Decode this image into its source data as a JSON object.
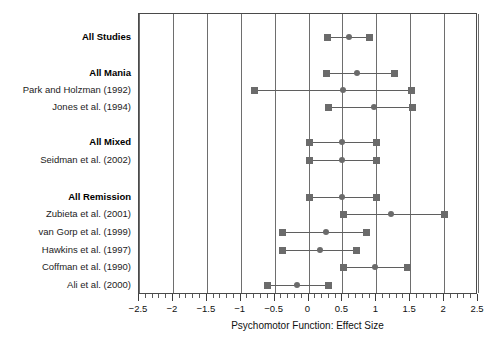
{
  "chart_data": {
    "type": "forest",
    "title": "",
    "xlabel": "Psychomotor Function: Effect Size",
    "ylabel": "",
    "xlim": [
      -2.5,
      2.5
    ],
    "grid": true,
    "legend": "none",
    "xticks": [
      -2.5,
      -2,
      -1.5,
      -1,
      -0.5,
      0,
      0.5,
      1,
      1.5,
      2,
      2.5
    ],
    "xtick_labels": [
      "−2.5",
      "−2",
      "−1.5",
      "−1",
      "−0.5",
      "0",
      "0.5",
      "1",
      "1.5",
      "2",
      "2.5"
    ],
    "minor_tick_step": 0.1,
    "marker_color": "#6b6b6b",
    "line_color": "#5f5f5f",
    "gridline_color": "#6e6e6e",
    "frame_color": "#4a4a4a",
    "rows": [
      {
        "label": "All Studies",
        "group": true,
        "y": 36,
        "estimate": 0.6,
        "low": 0.28,
        "high": 0.9
      },
      {
        "label": "All Mania",
        "group": true,
        "y": 72,
        "estimate": 0.72,
        "low": 0.27,
        "high": 1.27
      },
      {
        "label": "Park and Holzman (1992)",
        "group": false,
        "y": 89,
        "estimate": 0.51,
        "low": -0.79,
        "high": 1.52
      },
      {
        "label": "Jones et al. (1994)",
        "group": false,
        "y": 106,
        "estimate": 0.96,
        "low": 0.3,
        "high": 1.53
      },
      {
        "label": "All Mixed",
        "group": true,
        "y": 141,
        "estimate": 0.5,
        "low": 0.01,
        "high": 1.0
      },
      {
        "label": "Seidman et al. (2002)",
        "group": false,
        "y": 159,
        "estimate": 0.5,
        "low": 0.01,
        "high": 1.0
      },
      {
        "label": "All Remission",
        "group": true,
        "y": 196,
        "estimate": 0.5,
        "low": 0.02,
        "high": 1.0
      },
      {
        "label": "Zubieta et al. (2001)",
        "group": false,
        "y": 213,
        "estimate": 1.22,
        "low": 0.51,
        "high": 2.0
      },
      {
        "label": "van Gorp et al. (1999)",
        "group": false,
        "y": 231,
        "estimate": 0.26,
        "low": -0.38,
        "high": 0.86
      },
      {
        "label": "Hawkins et al. (1997)",
        "group": false,
        "y": 249,
        "estimate": 0.17,
        "low": -0.38,
        "high": 0.71
      },
      {
        "label": "Coffman et al. (1990)",
        "group": false,
        "y": 266,
        "estimate": 0.98,
        "low": 0.52,
        "high": 1.46
      },
      {
        "label": "Ali et al. (2000)",
        "group": false,
        "y": 284,
        "estimate": -0.17,
        "low": -0.61,
        "high": 0.3
      }
    ]
  }
}
